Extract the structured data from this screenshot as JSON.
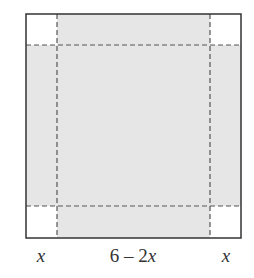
{
  "diagram": {
    "colors": {
      "shaded_fill": "#e6e6e6",
      "corner_fill": "#ffffff",
      "outline": "#333333",
      "dashed": "#555555"
    },
    "labels": {
      "left": "x",
      "middle": "6 – 2x",
      "right": "x"
    }
  }
}
